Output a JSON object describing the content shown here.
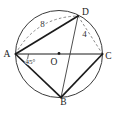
{
  "figure": {
    "kind": "circle-geometry-diagram",
    "background_color": "#ffffff",
    "ink_color": "#1b1b1b",
    "thin_line_color": "#3a3a3a",
    "dashed_line_color": "#7a7a7a",
    "labels": {
      "A": "A",
      "B": "B",
      "C": "C",
      "D": "D",
      "O": "O"
    },
    "measurements": {
      "AD": "8",
      "DC": "4",
      "angle_BAC": "45°"
    }
  }
}
